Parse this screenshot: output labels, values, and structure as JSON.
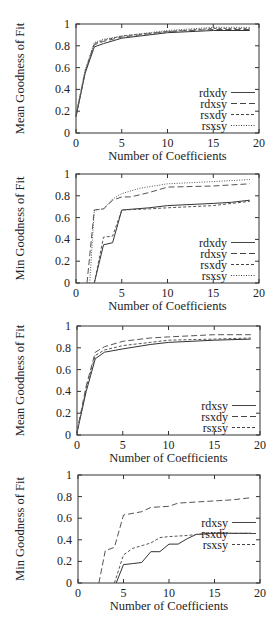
{
  "chart_data": [
    {
      "type": "line",
      "title": "",
      "xlabel": "Number of Coefficients",
      "ylabel": "Mean Goodness of Fit",
      "xlim": [
        0,
        20
      ],
      "ylim": [
        0,
        1
      ],
      "xticks": [
        0,
        5,
        10,
        15,
        20
      ],
      "yticks": [
        0,
        0.2,
        0.4,
        0.6,
        0.8,
        1
      ],
      "grid": false,
      "legend_position": "lower right",
      "series": [
        {
          "name": "rdxdy",
          "style": "solid",
          "x": [
            0,
            1,
            2,
            3,
            5,
            10,
            15,
            19
          ],
          "y": [
            0.15,
            0.55,
            0.79,
            0.82,
            0.87,
            0.92,
            0.94,
            0.94
          ]
        },
        {
          "name": "rdxsy",
          "style": "dashed",
          "x": [
            0,
            1,
            2,
            3,
            5,
            10,
            15,
            19
          ],
          "y": [
            0.15,
            0.56,
            0.81,
            0.84,
            0.88,
            0.93,
            0.95,
            0.95
          ]
        },
        {
          "name": "rsxdy",
          "style": "shortdash",
          "x": [
            0,
            1,
            2,
            3,
            5,
            10,
            15,
            19
          ],
          "y": [
            0.16,
            0.57,
            0.82,
            0.85,
            0.89,
            0.93,
            0.96,
            0.96
          ]
        },
        {
          "name": "rsxsy",
          "style": "dotted",
          "x": [
            0,
            1,
            2,
            3,
            5,
            10,
            15,
            19
          ],
          "y": [
            0.17,
            0.58,
            0.83,
            0.86,
            0.89,
            0.94,
            0.97,
            0.97
          ]
        }
      ]
    },
    {
      "type": "line",
      "title": "",
      "xlabel": "Number of Coefficients",
      "ylabel": "Min Goodness of Fit",
      "xlim": [
        0,
        20
      ],
      "ylim": [
        0,
        1
      ],
      "xticks": [
        0,
        5,
        10,
        15,
        20
      ],
      "yticks": [
        0,
        0.2,
        0.4,
        0.6,
        0.8,
        1
      ],
      "grid": false,
      "legend_position": "lower right",
      "series": [
        {
          "name": "rdxdy",
          "style": "solid",
          "x": [
            2,
            3,
            4,
            5,
            8,
            10,
            15,
            17,
            19
          ],
          "y": [
            0,
            0.35,
            0.37,
            0.67,
            0.69,
            0.71,
            0.73,
            0.74,
            0.76
          ]
        },
        {
          "name": "rdxsy",
          "style": "dashed",
          "x": [
            1.2,
            2,
            3,
            4,
            5,
            6,
            8,
            10,
            15,
            19
          ],
          "y": [
            0,
            0.67,
            0.68,
            0.76,
            0.79,
            0.79,
            0.83,
            0.88,
            0.89,
            0.91
          ]
        },
        {
          "name": "rsxdy",
          "style": "shortdash",
          "x": [
            2,
            3,
            4,
            5,
            8,
            10,
            15,
            19
          ],
          "y": [
            0,
            0.42,
            0.43,
            0.67,
            0.68,
            0.69,
            0.71,
            0.75
          ]
        },
        {
          "name": "rsxsy",
          "style": "dotted",
          "x": [
            1.5,
            2,
            3,
            4,
            5,
            7,
            10,
            15,
            19
          ],
          "y": [
            0,
            0.67,
            0.68,
            0.77,
            0.82,
            0.87,
            0.91,
            0.93,
            0.95
          ]
        }
      ]
    },
    {
      "type": "line",
      "title": "",
      "xlabel": "Number of Coefficients",
      "ylabel": "Mean Goodness of Fit",
      "xlim": [
        0,
        20
      ],
      "ylim": [
        0,
        1
      ],
      "xticks": [
        0,
        5,
        10,
        15,
        20
      ],
      "yticks": [
        0,
        0.2,
        0.4,
        0.6,
        0.8,
        1
      ],
      "grid": false,
      "legend_position": "lower right",
      "series": [
        {
          "name": "rdxsy",
          "style": "solid",
          "x": [
            0,
            1,
            2,
            3,
            5,
            8,
            10,
            15,
            19
          ],
          "y": [
            0.02,
            0.4,
            0.7,
            0.76,
            0.79,
            0.83,
            0.85,
            0.87,
            0.88
          ]
        },
        {
          "name": "rsxdy",
          "style": "dashed",
          "x": [
            0,
            1,
            2,
            3,
            5,
            8,
            10,
            15,
            19
          ],
          "y": [
            0.03,
            0.45,
            0.76,
            0.81,
            0.86,
            0.89,
            0.9,
            0.92,
            0.92
          ]
        },
        {
          "name": "rsxsy",
          "style": "shortdash",
          "x": [
            0,
            1,
            2,
            3,
            5,
            8,
            10,
            15,
            19
          ],
          "y": [
            0.02,
            0.43,
            0.73,
            0.78,
            0.82,
            0.85,
            0.87,
            0.88,
            0.89
          ]
        }
      ]
    },
    {
      "type": "line",
      "title": "",
      "xlabel": "Number of Coefficients",
      "ylabel": "Min Goodness of Fit",
      "xlim": [
        0,
        20
      ],
      "ylim": [
        0,
        1
      ],
      "xticks": [
        0,
        5,
        10,
        15,
        20
      ],
      "yticks": [
        0,
        0.2,
        0.4,
        0.6,
        0.8,
        1
      ],
      "grid": false,
      "legend_position": "right",
      "series": [
        {
          "name": "rdxsy",
          "style": "solid",
          "x": [
            4.2,
            5,
            6,
            7,
            8,
            9,
            10,
            11,
            12,
            13,
            15,
            19
          ],
          "y": [
            0,
            0.17,
            0.18,
            0.19,
            0.29,
            0.29,
            0.36,
            0.36,
            0.41,
            0.45,
            0.46,
            0.46
          ]
        },
        {
          "name": "rsxdy",
          "style": "dashed",
          "x": [
            2.3,
            3,
            4,
            5,
            7,
            8,
            10,
            11,
            13,
            15,
            17,
            19
          ],
          "y": [
            0,
            0.3,
            0.33,
            0.63,
            0.66,
            0.7,
            0.71,
            0.74,
            0.75,
            0.76,
            0.77,
            0.79
          ]
        },
        {
          "name": "rsxsy",
          "style": "shortdash",
          "x": [
            4,
            5,
            6,
            8,
            9,
            10,
            12,
            13,
            15,
            19
          ],
          "y": [
            0,
            0.26,
            0.32,
            0.37,
            0.42,
            0.43,
            0.44,
            0.45,
            0.46,
            0.46
          ]
        }
      ]
    }
  ],
  "page": {
    "top_right_fragment": "-"
  }
}
